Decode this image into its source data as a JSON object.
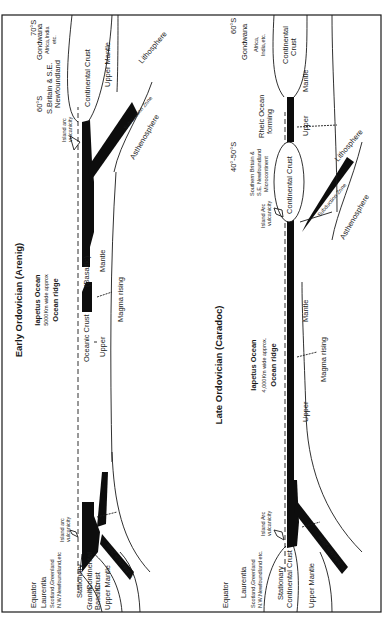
{
  "figure": {
    "panels": [
      {
        "title": "Early Ordovician (Arenig)",
        "ocean": {
          "name": "Iapetus Ocean",
          "width": "5000Km wide approx",
          "ridge": "Ocean ridge"
        },
        "left_margin": {
          "lat": "Equator",
          "continent": "Laurentia",
          "regions_1": "Scotland,Greenland",
          "regions_2": "N.W.Newfoundland,etc",
          "crust_top": "Stationary",
          "crust_granitic": "Granitic",
          "crust_continental": "Continental",
          "crust_basaltic": "Basaltic",
          "crust_word": "Crust",
          "mantle": "Upper Mantle",
          "arc_1": "Island arc",
          "arc_2": "vulcanicity",
          "subduction": "Subduction Zone"
        },
        "centre": {
          "oceanic_crust": "Oceanic Crust",
          "basaltic": "(Basaltic)",
          "upper": "Upper",
          "mantle": "Mantle",
          "magma": "Magma rising"
        },
        "right_margin": {
          "lat_a": "60°S",
          "lat_b": "70°S",
          "region_1": "S.Britain & S.E.",
          "region_2": "Newfoundland",
          "continent": "Gondwana",
          "continent_sub_1": "Africa,India",
          "continent_sub_2": "etc.",
          "crust": "Continental Crust",
          "mantle": "Upper Mantle",
          "arc_1": "Island arc",
          "arc_2": "vulcanicity",
          "subduction": "Subduction Zone",
          "lithosphere": "Lithosphere",
          "asthenosphere": "Asthenosphere"
        }
      },
      {
        "title": "Late Ordovician (Caradoc)",
        "ocean": {
          "name": "Iapetus Ocean",
          "width": "4,000Km wide approx.",
          "ridge": "Ocean ridge"
        },
        "left_margin": {
          "lat": "Equator",
          "continent": "Laurentia",
          "regions_1": "Scotland,Greenland",
          "regions_2": "N.W.Newfoundland etc.",
          "crust_1": "Stationary",
          "crust_2": "Continental Crust",
          "mantle": "Upper Mantle",
          "arc_1": "Island Arc",
          "arc_2": "vulcanicity",
          "subduction": "Subduction Zone"
        },
        "centre": {
          "upper": "Upper",
          "mantle": "Mantle",
          "magma": "Magma rising"
        },
        "right_margin": {
          "lat_a": "40°-50°S",
          "lat_b": "60°S",
          "micro_1": "Southern Britain &",
          "micro_2": "S.E. Newfoundland",
          "micro_3": "Microcontinent",
          "micro_crust": "Continental Crust",
          "arc_1": "Island Arc",
          "arc_2": "vulcanicity",
          "subduction": "Subduction Zone",
          "lithosphere": "Lithosphere",
          "asthenosphere": "Asthenosphere",
          "rheic_1": "Rheic Ocean",
          "rheic_2": "forming",
          "upper": "Upper",
          "mantle": "Mantle",
          "continent": "Gondwana",
          "continent_sub_1": "Africa,",
          "continent_sub_2": "India,etc.",
          "crust_1": "Continental",
          "crust_2": "Crust"
        }
      }
    ]
  }
}
